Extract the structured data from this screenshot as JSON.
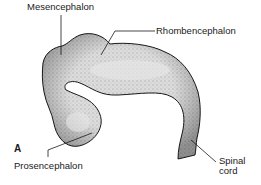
{
  "figure": {
    "panel_letter": "A",
    "labels": {
      "mesencephalon": "Mesencephalon",
      "rhombencephalon": "Rhombencephalon",
      "prosencephalon": "Prosencephalon",
      "spinal_cord_line1": "Spinal",
      "spinal_cord_line2": "cord"
    },
    "colors": {
      "fill": "#d9d9d9",
      "outline": "#1a1a1a",
      "stipple": "#333333",
      "leader": "#1a1a1a"
    }
  }
}
